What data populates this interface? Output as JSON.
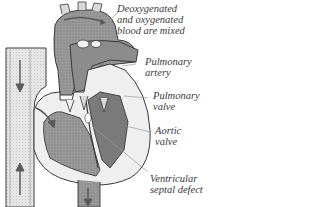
{
  "diagram": {
    "colors": {
      "outline": "#3a3a3a",
      "vessel_fill": "#d9d9d9",
      "chamber_fill": "#8c8c8c",
      "dark_fill": "#6e6e6e",
      "light_fill": "#efefef",
      "arrow": "#5a5a5a",
      "leader": "#9a9a9a",
      "text": "#3a3a3a"
    },
    "labels": [
      {
        "id": "mixed",
        "lines": [
          "Deoxygenated",
          "and oxygenated",
          "blood are mixed"
        ]
      },
      {
        "id": "pulmonary-artery",
        "lines": [
          "Pulmonary",
          "artery"
        ]
      },
      {
        "id": "pulmonary-valve",
        "lines": [
          "Pulmonary",
          "valve"
        ]
      },
      {
        "id": "aortic-valve",
        "lines": [
          "Aortic",
          "valve"
        ]
      },
      {
        "id": "vsd",
        "lines": [
          "Ventricular",
          "septal defect"
        ]
      }
    ]
  }
}
